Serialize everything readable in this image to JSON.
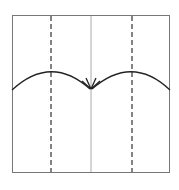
{
  "diagram": {
    "type": "origami-fold-diagram",
    "paper": {
      "x": 12,
      "y": 15,
      "width": 158,
      "height": 158,
      "stroke": "#777777"
    },
    "center_crease": {
      "x": 91,
      "stroke": "#aaaaaa",
      "style": "solid"
    },
    "valley_folds": [
      {
        "x": 51,
        "style": "dashed",
        "stroke": "#333333"
      },
      {
        "x": 132,
        "style": "dashed",
        "stroke": "#333333"
      }
    ],
    "fold_arrows": [
      {
        "from_x": 12,
        "from_y": 90,
        "peak_x": 51,
        "peak_y": 72,
        "to_x": 90,
        "to_y": 89,
        "direction": "fold-left-edge-to-center"
      },
      {
        "from_x": 170,
        "from_y": 90,
        "peak_x": 132,
        "peak_y": 72,
        "to_x": 92,
        "to_y": 89,
        "direction": "fold-right-edge-to-center"
      }
    ],
    "colors": {
      "line": "#222222",
      "background": "#ffffff"
    }
  }
}
